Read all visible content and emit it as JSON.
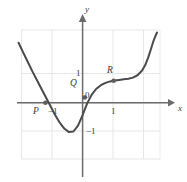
{
  "figure": {
    "caption": "Graph of a cubic-like curve with marked points P, Q and R",
    "background_color": "#ffffff",
    "grid_color": "#e4e4e4",
    "axis_color": "#5a5a5a",
    "curve_color": "#4a4a4a",
    "point_color": "#5f5f5f",
    "text_color": "#3b3b3b"
  },
  "axes": {
    "x_axis_label": "x",
    "y_axis_label": "y",
    "origin_label": "0",
    "x_ticks": [
      {
        "label": "1",
        "value": 1
      }
    ],
    "y_ticks": [
      {
        "label": "1",
        "value": 1
      },
      {
        "label": "−1",
        "value": -1
      }
    ],
    "x_negative_tick": {
      "label": "−1",
      "value": -1
    },
    "xlim": [
      -2.1,
      2.9
    ],
    "ylim": [
      -1.75,
      2.4
    ],
    "grid": true,
    "grid_step": 1
  },
  "chart_data": {
    "type": "line",
    "title": "",
    "xlabel": "x",
    "ylabel": "y",
    "xlim": [
      -2.1,
      2.9
    ],
    "ylim": [
      -1.75,
      2.4
    ],
    "grid": true,
    "legend": "none",
    "series": [
      {
        "name": "curve",
        "x": [
          -2.1,
          -1.95,
          -1.8,
          -1.65,
          -1.5,
          -1.35,
          -1.2,
          -1.05,
          -0.9,
          -0.75,
          -0.6,
          -0.45,
          -0.3,
          -0.15,
          0.0,
          0.15,
          0.3,
          0.45,
          0.6,
          0.75,
          0.9,
          1.05,
          1.2,
          1.35,
          1.5,
          1.65,
          1.8,
          1.95,
          2.05,
          2.15,
          2.25,
          2.32,
          2.38,
          2.44
        ],
        "y": [
          2.05,
          1.72,
          1.4,
          1.08,
          0.78,
          0.48,
          0.18,
          -0.12,
          -0.42,
          -0.68,
          -0.88,
          -1.0,
          -0.98,
          -0.78,
          -0.42,
          -0.02,
          0.28,
          0.48,
          0.6,
          0.68,
          0.73,
          0.76,
          0.78,
          0.8,
          0.82,
          0.86,
          0.94,
          1.1,
          1.28,
          1.54,
          1.86,
          2.1,
          2.26,
          2.4
        ]
      }
    ],
    "points": [
      {
        "label": "P",
        "x": -1.22,
        "y": 0.0,
        "label_dx": -4,
        "label_dy": 9
      },
      {
        "label": "Q",
        "x": 0.07,
        "y": 0.18,
        "label_dx": -11,
        "label_dy": -1
      },
      {
        "label": "R",
        "x": 1.02,
        "y": 0.75,
        "label_dx": -2,
        "label_dy": -9
      }
    ],
    "annotations": [
      {
        "text": "0",
        "x": 0.16,
        "y": 0.22
      },
      {
        "text": "1",
        "x": 1.0,
        "y": -0.33
      },
      {
        "text": "1",
        "x": -0.17,
        "y": 1.0
      },
      {
        "text": "−1",
        "x": -1.0,
        "y": -0.33
      },
      {
        "text": "−1",
        "x": 0.22,
        "y": -1.0
      }
    ]
  }
}
